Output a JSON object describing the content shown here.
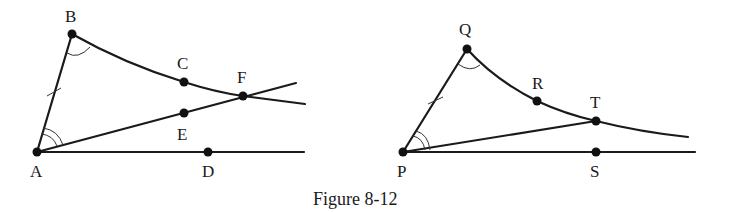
{
  "caption": "Figure 8-12",
  "figures": [
    {
      "id": "left",
      "points": {
        "A": {
          "label": "A",
          "x": 37,
          "y": 152
        },
        "B": {
          "label": "B",
          "x": 72,
          "y": 34
        },
        "C": {
          "label": "C",
          "x": 184,
          "y": 82
        },
        "D": {
          "label": "D",
          "x": 208,
          "y": 152
        },
        "E": {
          "label": "E",
          "x": 184,
          "y": 113
        },
        "F": {
          "label": "F",
          "x": 243,
          "y": 96
        }
      },
      "marks": [
        "tick on AB",
        "single arc at B",
        "double arc at A"
      ]
    },
    {
      "id": "right",
      "points": {
        "P": {
          "label": "P",
          "x": 403,
          "y": 152
        },
        "Q": {
          "label": "Q",
          "x": 467,
          "y": 49
        },
        "R": {
          "label": "R",
          "x": 537,
          "y": 101
        },
        "S": {
          "label": "S",
          "x": 596,
          "y": 152
        },
        "T": {
          "label": "T",
          "x": 596,
          "y": 121
        }
      },
      "marks": [
        "tick on PQ",
        "single arc at Q",
        "double arc at P"
      ]
    }
  ],
  "colors": {
    "ink": "#1a1a1a",
    "background": "#ffffff"
  }
}
